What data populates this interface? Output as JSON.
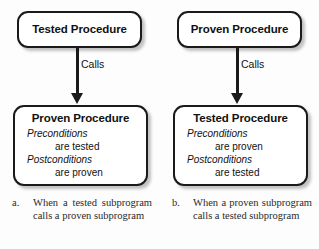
{
  "figure": {
    "panels": [
      {
        "id": "panel-a",
        "top_node": {
          "title": "Tested Procedure"
        },
        "arrow": {
          "label": "Calls"
        },
        "bottom_node": {
          "title": "Proven Procedure",
          "conditions": [
            {
              "kind": "Preconditions",
              "value": "are tested"
            },
            {
              "kind": "Postconditions",
              "value": "are proven"
            }
          ]
        },
        "caption": {
          "marker": "a.",
          "text": "When a tested subpro­gram calls a proven sub­program"
        }
      },
      {
        "id": "panel-b",
        "top_node": {
          "title": "Proven Procedure"
        },
        "arrow": {
          "label": "Calls"
        },
        "bottom_node": {
          "title": "Tested Procedure",
          "conditions": [
            {
              "kind": "Preconditions",
              "value": "are proven"
            },
            {
              "kind": "Postconditions",
              "value": "are tested"
            }
          ]
        },
        "caption": {
          "marker": "b.",
          "text": "When a proven subpro­gram calls a tested sub­program"
        }
      }
    ],
    "colors": {
      "background": "#fdfdfd",
      "stroke": "#1a1a1a",
      "box_fill": "#ffffff",
      "text": "#111111",
      "caption_text": "#2a2a2a"
    }
  }
}
